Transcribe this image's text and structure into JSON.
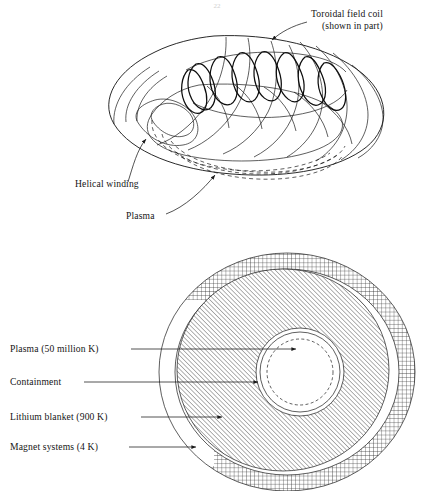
{
  "figure": {
    "page_number": "22",
    "background_color": "#ffffff",
    "ink_color": "#1a1a1a"
  },
  "top_diagram": {
    "name": "toroidal-reactor-perspective",
    "labels": [
      {
        "id": "toroidal-field-coil",
        "line1": "Toroidal field coil",
        "line2": "(shown in part)",
        "x": 311,
        "y": 17,
        "y2": 29
      },
      {
        "id": "helical-winding",
        "line1": "Helical winding",
        "x": 75,
        "y": 187
      },
      {
        "id": "plasma",
        "line1": "Plasma",
        "x": 126,
        "y": 219
      }
    ]
  },
  "cross_section": {
    "name": "reactor-cross-section",
    "labels": [
      {
        "id": "plasma-temperature",
        "text": "Plasma (50 million K)",
        "x": 10,
        "y": 352
      },
      {
        "id": "containment",
        "text": "Containment",
        "x": 10,
        "y": 385
      },
      {
        "id": "lithium-blanket",
        "text": "Lithium blanket (900 K)",
        "x": 10,
        "y": 420
      },
      {
        "id": "magnet-systems",
        "text": "Magnet systems (4 K)",
        "x": 10,
        "y": 450
      }
    ],
    "regions": [
      {
        "id": "magnet-systems-region",
        "fill": "crosshatch",
        "label": "Magnet systems (4 K)"
      },
      {
        "id": "lithium-blanket-region",
        "fill": "diagonal-hatch",
        "label": "Lithium blanket (900 K)"
      },
      {
        "id": "containment-region",
        "fill": "white",
        "label": "Containment"
      },
      {
        "id": "plasma-region",
        "fill": "dashed-outline",
        "label": "Plasma (50 million K)"
      }
    ]
  }
}
